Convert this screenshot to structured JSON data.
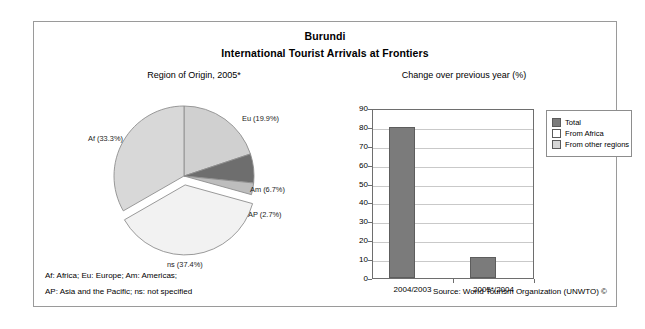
{
  "title": {
    "country": "Burundi",
    "subtitle": "International Tourist Arrivals at Frontiers"
  },
  "panels": {
    "pie_heading": "Region of Origin, 2005*",
    "bar_heading": "Change over previous year (%)"
  },
  "footer": {
    "note_line1": "Af: Africa; Eu: Europe; Am: Americas;",
    "note_line2": "AP: Asia and the Pacific; ns: not specified",
    "source": "Source: World Tourism Organization (UNWTO) ©"
  },
  "colors": {
    "total_bar": "#7b7b7b",
    "slice_eu": "#d0d0d0",
    "slice_am": "#6e6e6e",
    "slice_ap": "#bdbdbd",
    "slice_ns": "#f2f2f2",
    "slice_af": "#d8d8d8",
    "gridline": "#c9c9c9",
    "frame": "#9a9a9a"
  },
  "chart_data": [
    {
      "type": "pie",
      "title": "Region of Origin, 2005*",
      "legend": "labels",
      "unit": "%",
      "labels": [
        "Eu (19.9%)",
        "Am (6.7%)",
        "AP (2.7%)",
        "ns (37.4%)",
        "Af (33.3%)"
      ],
      "categories": [
        "Eu",
        "Am",
        "AP",
        "ns",
        "Af"
      ],
      "values": [
        19.9,
        6.7,
        2.7,
        37.4,
        33.3
      ],
      "exploded": [
        "ns"
      ],
      "slice_colors": [
        "#d0d0d0",
        "#6e6e6e",
        "#bdbdbd",
        "#f2f2f2",
        "#d8d8d8"
      ]
    },
    {
      "type": "bar",
      "title": "Change over previous year (%)",
      "xlabel": "",
      "ylabel": "",
      "ylim": [
        0,
        90
      ],
      "yticks": [
        0,
        10,
        20,
        30,
        40,
        50,
        60,
        70,
        80,
        90
      ],
      "grid": true,
      "legend_position": "right",
      "categories": [
        "2004/2003",
        "2005*/2004"
      ],
      "series": [
        {
          "name": "Total",
          "values": [
            80,
            11
          ],
          "color": "#7b7b7b"
        },
        {
          "name": "From Africa",
          "values": [
            null,
            null
          ],
          "color": "#ffffff"
        },
        {
          "name": "From other regions",
          "values": [
            null,
            null
          ],
          "color": "#d6d6d6"
        }
      ]
    }
  ]
}
